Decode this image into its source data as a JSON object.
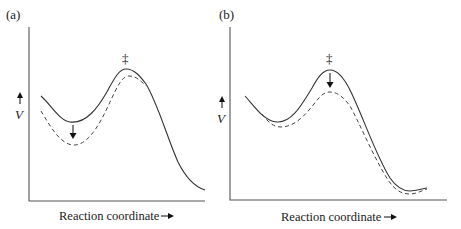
{
  "figure": {
    "panels": [
      {
        "id": "a",
        "label": "(a)",
        "y_axis_label": "V",
        "x_axis_label": "Reaction coordinate",
        "transition_state_marker": "‡",
        "description": "Reactant well lowered (dashed) relative to original (solid); arrow points down at reactant minimum",
        "arrow_location": "reactant-minimum"
      },
      {
        "id": "b",
        "label": "(b)",
        "y_axis_label": "V",
        "x_axis_label": "Reaction coordinate",
        "transition_state_marker": "‡",
        "description": "Transition state lowered (dashed) relative to original (solid); arrow points down at barrier top",
        "arrow_location": "transition-state"
      }
    ],
    "legend": {
      "solid": "original potential energy profile",
      "dashed": "perturbed potential energy profile"
    },
    "colors": {
      "line": "#333333",
      "axis": "#555555",
      "background": "#ffffff"
    }
  }
}
